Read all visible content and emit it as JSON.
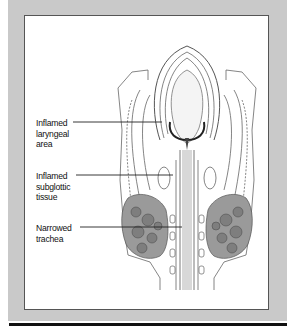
{
  "figure": {
    "panel_color": "#c9c9c9",
    "labels": [
      {
        "id": "inflamed-laryngeal-area",
        "text": "Inflamed\nlaryngeal\narea"
      },
      {
        "id": "inflamed-subglottic-tissue",
        "text": "Inflamed\nsubglottic\ntissue"
      },
      {
        "id": "narrowed-trachea",
        "text": "Narrowed\ntrachea"
      }
    ]
  }
}
